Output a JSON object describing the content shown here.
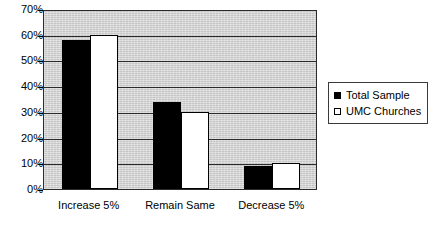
{
  "chart_data": {
    "type": "bar",
    "title": "",
    "subtitle": "",
    "xlabel": "",
    "ylabel": "",
    "categories": [
      "Increase 5%",
      "Remain Same",
      "Decrease 5%"
    ],
    "series": [
      {
        "name": "Total Sample",
        "values": [
          58,
          34,
          9
        ],
        "color": "#000000",
        "swatch": "filled-square"
      },
      {
        "name": "UMC Churches",
        "values": [
          60,
          30,
          10
        ],
        "color": "#ffffff",
        "swatch": "outline-square"
      }
    ],
    "ylim": [
      0,
      70
    ],
    "ytick_values": [
      0,
      10,
      20,
      30,
      40,
      50,
      60,
      70
    ],
    "ytick_labels": [
      "0%",
      "10%",
      "20%",
      "30%",
      "40%",
      "50%",
      "60%",
      "70%"
    ],
    "yunit": "%",
    "grid": true,
    "grid_axis": "y",
    "legend_position": "right-outside",
    "plot_background": "#d3d3d3",
    "frame_background": "#ffffff",
    "border_color": "#2b2b2b"
  },
  "legend": {
    "entries": [
      {
        "label": "Total Sample"
      },
      {
        "label": "UMC Churches"
      }
    ]
  }
}
